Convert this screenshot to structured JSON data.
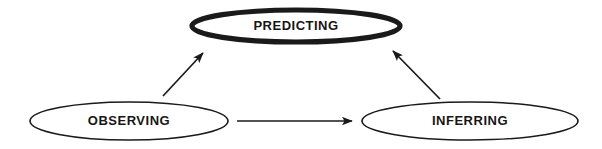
{
  "diagram": {
    "background_color": "#ffffff",
    "stroke_color": "#1a1a1a",
    "text_color": "#161616",
    "nodes": [
      {
        "id": "predicting",
        "label": "PREDICTING",
        "shape": "ellipse",
        "emphasis": "thick",
        "cx": 296,
        "cy": 26,
        "rx": 104,
        "ry": 16
      },
      {
        "id": "observing",
        "label": "OBSERVING",
        "shape": "ellipse",
        "emphasis": "thin",
        "cx": 129,
        "cy": 121,
        "rx": 99,
        "ry": 19
      },
      {
        "id": "inferring",
        "label": "INFERRING",
        "shape": "ellipse",
        "emphasis": "thin",
        "cx": 470,
        "cy": 121,
        "rx": 108,
        "ry": 19
      }
    ],
    "connectors": [
      {
        "id": "observing-to-predicting",
        "from": "observing",
        "to": "predicting",
        "direction": "up-right",
        "x1": 163,
        "y1": 96,
        "x2": 210,
        "y2": 46
      },
      {
        "id": "inferring-to-predicting",
        "from": "inferring",
        "to": "predicting",
        "direction": "up-left",
        "x1": 440,
        "y1": 99,
        "x2": 386,
        "y2": 44
      },
      {
        "id": "observing-to-inferring",
        "from": "observing",
        "to": "inferring",
        "direction": "right",
        "x1": 237,
        "y1": 121,
        "x2": 360,
        "y2": 121
      }
    ]
  }
}
